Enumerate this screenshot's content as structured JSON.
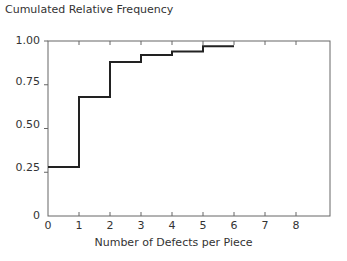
{
  "chart_data": {
    "type": "line",
    "style": "step",
    "title": "Cumulated Relative Frequency",
    "xlabel": "Number of Defects per Piece",
    "ylabel": "Cumulated Relative Frequency",
    "x_ticks": [
      "0",
      "1",
      "2",
      "3",
      "4",
      "5",
      "6",
      "7",
      "8"
    ],
    "y_ticks": [
      "0",
      "0.25",
      "0.50",
      "0.75",
      "1.00"
    ],
    "xlim": [
      0,
      9
    ],
    "ylim": [
      0,
      1.0
    ],
    "grid": false,
    "legend": null,
    "steps": [
      {
        "x_start": 0,
        "x_end": 1,
        "y": 0.28
      },
      {
        "x_start": 1,
        "x_end": 2,
        "y": 0.68
      },
      {
        "x_start": 2,
        "x_end": 3,
        "y": 0.88
      },
      {
        "x_start": 3,
        "x_end": 4,
        "y": 0.92
      },
      {
        "x_start": 4,
        "x_end": 5,
        "y": 0.94
      },
      {
        "x_start": 5,
        "x_end": 6,
        "y": 0.97
      }
    ],
    "x": [
      0,
      1,
      2,
      3,
      4,
      5
    ],
    "values": [
      0.28,
      0.68,
      0.88,
      0.92,
      0.94,
      0.97
    ]
  },
  "labels": {
    "title": "Cumulated Relative Frequency",
    "xlabel": "Number of Defects per Piece",
    "yticks": [
      "0",
      "0.25",
      "0.50",
      "0.75",
      "1.00"
    ],
    "xticks": [
      "0",
      "1",
      "2",
      "3",
      "4",
      "5",
      "6",
      "7",
      "8"
    ]
  },
  "colors": {
    "line": "#222222",
    "axis": "#555555",
    "text": "#333333"
  }
}
